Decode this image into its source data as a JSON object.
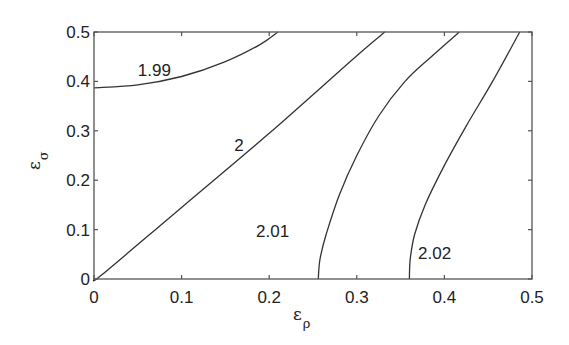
{
  "chart_data": {
    "type": "line",
    "subtype": "contour",
    "title": "",
    "xlabel": "ε_ρ",
    "ylabel": "ε_σ",
    "xlabel_main": "ε",
    "xlabel_sub": "ρ",
    "ylabel_main": "ε",
    "ylabel_sub": "σ",
    "xlim": [
      0,
      0.5
    ],
    "ylim": [
      0,
      0.5
    ],
    "grid": false,
    "legend": "none",
    "x_ticks": [
      0,
      0.1,
      0.2,
      0.3,
      0.4,
      0.5
    ],
    "y_ticks": [
      0,
      0.1,
      0.2,
      0.3,
      0.4,
      0.5
    ],
    "x_tick_labels": [
      "0",
      "0.1",
      "0.2",
      "0.3",
      "0.4",
      "0.5"
    ],
    "y_tick_labels": [
      "0",
      "0.1",
      "0.2",
      "0.3",
      "0.4",
      "0.5"
    ],
    "series": [
      {
        "name": "1.99",
        "label": "1.99",
        "label_pos": [
          0.05,
          0.41
        ],
        "x": [
          0,
          0.05,
          0.1,
          0.15,
          0.19,
          0.21
        ],
        "y": [
          0.387,
          0.393,
          0.41,
          0.44,
          0.475,
          0.5
        ]
      },
      {
        "name": "2",
        "label": "2",
        "label_pos": [
          0.16,
          0.26
        ],
        "x": [
          0,
          0.01,
          0.1,
          0.2,
          0.3,
          0.332
        ],
        "y": [
          0,
          0.01,
          0.145,
          0.295,
          0.452,
          0.5
        ]
      },
      {
        "name": "2.01",
        "label": "2.01",
        "label_pos": [
          0.185,
          0.085
        ],
        "x": [
          0.256,
          0.258,
          0.265,
          0.28,
          0.3,
          0.325,
          0.355,
          0.385,
          0.417
        ],
        "y": [
          0,
          0.04,
          0.09,
          0.17,
          0.25,
          0.33,
          0.4,
          0.45,
          0.5
        ]
      },
      {
        "name": "2.02",
        "label": "2.02",
        "label_pos": [
          0.37,
          0.04
        ],
        "x": [
          0.36,
          0.361,
          0.366,
          0.378,
          0.4,
          0.425,
          0.455,
          0.486
        ],
        "y": [
          0,
          0.04,
          0.09,
          0.15,
          0.23,
          0.31,
          0.4,
          0.5
        ]
      }
    ]
  }
}
